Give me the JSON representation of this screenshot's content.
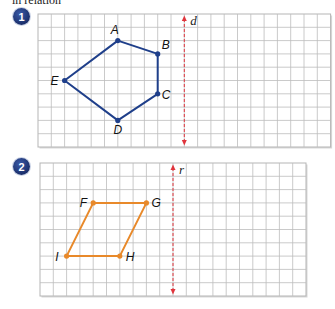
{
  "header": {
    "cut_text": "in relation"
  },
  "figures": [
    {
      "number": "1",
      "grid": {
        "x": 38,
        "y": 14,
        "cols": 22,
        "rows": 10,
        "cell": 13.3
      },
      "shape": "pentagon",
      "color": "#1f3f8a",
      "vertices": [
        {
          "label": "A",
          "col": 6,
          "row": 2
        },
        {
          "label": "B",
          "col": 9,
          "row": 3
        },
        {
          "label": "C",
          "col": 9,
          "row": 6
        },
        {
          "label": "D",
          "col": 6,
          "row": 8
        },
        {
          "label": "E",
          "col": 2,
          "row": 5
        }
      ],
      "axis": {
        "label": "d",
        "col": 11,
        "color": "#e0343c"
      }
    },
    {
      "number": "2",
      "grid": {
        "x": 40,
        "y": 163,
        "cols": 20,
        "rows": 10,
        "cell": 13.3
      },
      "shape": "parallelogram",
      "color": "#e8892a",
      "vertices": [
        {
          "label": "F",
          "col": 4,
          "row": 3
        },
        {
          "label": "G",
          "col": 8,
          "row": 3
        },
        {
          "label": "H",
          "col": 6,
          "row": 7
        },
        {
          "label": "I",
          "col": 2,
          "row": 7
        }
      ],
      "axis": {
        "label": "r",
        "col": 10,
        "color": "#e0343c"
      }
    }
  ]
}
